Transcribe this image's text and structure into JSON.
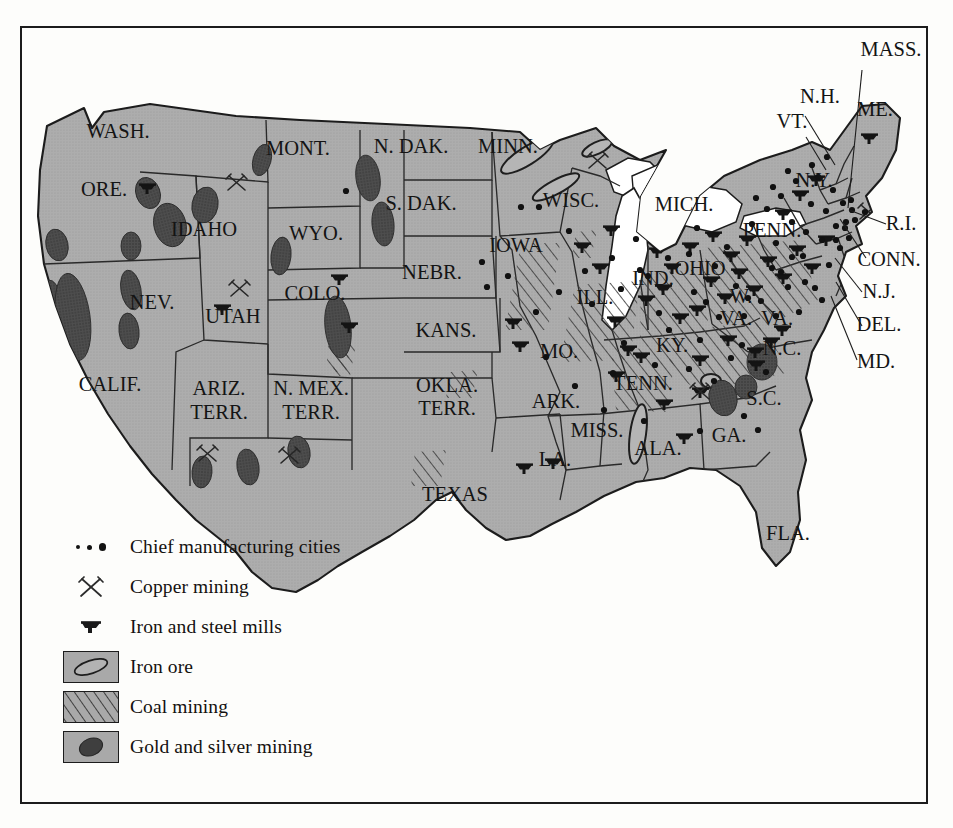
{
  "figure": {
    "kind": "thematic-map",
    "region": "United States",
    "era_note": "ARIZ. TERR., N. MEX. TERR., OKLA. TERR. shown as territories",
    "land_color": "#a9a9a9",
    "water_color": "#ffffff",
    "ink_color": "#1c1c1c",
    "ore_color": "#4a4a4a"
  },
  "legend": {
    "items": [
      {
        "symbol": "three-dots",
        "label": "Chief manufacturing cities"
      },
      {
        "symbol": "crossed-picks",
        "label": "Copper mining"
      },
      {
        "symbol": "anvil",
        "label": "Iron and steel mills"
      },
      {
        "symbol": "swatch-iron-ore",
        "label": "Iron ore"
      },
      {
        "symbol": "swatch-coal",
        "label": "Coal mining"
      },
      {
        "symbol": "swatch-gold",
        "label": "Gold and silver mining"
      }
    ]
  },
  "labels": {
    "inline": [
      {
        "text": "WASH.",
        "x": 118,
        "y": 138
      },
      {
        "text": "ORE.",
        "x": 104,
        "y": 196
      },
      {
        "text": "IDAHO",
        "x": 204,
        "y": 236
      },
      {
        "text": "MONT.",
        "x": 298,
        "y": 155
      },
      {
        "text": "WYO.",
        "x": 316,
        "y": 240
      },
      {
        "text": "N. DAK.",
        "x": 411,
        "y": 153
      },
      {
        "text": "S. DAK.",
        "x": 421,
        "y": 210
      },
      {
        "text": "NEBR.",
        "x": 432,
        "y": 279
      },
      {
        "text": "KANS.",
        "x": 446,
        "y": 337
      },
      {
        "text": "MINN.",
        "x": 508,
        "y": 153
      },
      {
        "text": "IOWA",
        "x": 516,
        "y": 252
      },
      {
        "text": "WISC.",
        "x": 571,
        "y": 207
      },
      {
        "text": "MICH.",
        "x": 684,
        "y": 211
      },
      {
        "text": "ILL.",
        "x": 595,
        "y": 304
      },
      {
        "text": "IND.",
        "x": 653,
        "y": 285
      },
      {
        "text": "OHIO",
        "x": 700,
        "y": 275
      },
      {
        "text": "MO.",
        "x": 559,
        "y": 358
      },
      {
        "text": "KY.",
        "x": 672,
        "y": 352
      },
      {
        "text": "NEV.",
        "x": 152,
        "y": 309
      },
      {
        "text": "UTAH",
        "x": 233,
        "y": 323
      },
      {
        "text": "COLO.",
        "x": 315,
        "y": 300
      },
      {
        "text": "CALIF.",
        "x": 110,
        "y": 391
      },
      {
        "text": "ARIZ.",
        "x": 219,
        "y": 395
      },
      {
        "text": "TERR.",
        "x": 219,
        "y": 419
      },
      {
        "text": "N. MEX.",
        "x": 311,
        "y": 395
      },
      {
        "text": "TERR.",
        "x": 311,
        "y": 419
      },
      {
        "text": "OKLA.",
        "x": 447,
        "y": 392
      },
      {
        "text": "TERR.",
        "x": 447,
        "y": 415
      },
      {
        "text": "ARK.",
        "x": 556,
        "y": 408
      },
      {
        "text": "TENN.",
        "x": 643,
        "y": 390
      },
      {
        "text": "MISS.",
        "x": 597,
        "y": 437
      },
      {
        "text": "LA.",
        "x": 555,
        "y": 466
      },
      {
        "text": "ALA.",
        "x": 658,
        "y": 455
      },
      {
        "text": "GA.",
        "x": 729,
        "y": 442
      },
      {
        "text": "FLA.",
        "x": 788,
        "y": 540
      },
      {
        "text": "S.C.",
        "x": 764,
        "y": 405
      },
      {
        "text": "N.C.",
        "x": 782,
        "y": 355
      },
      {
        "text": "W.",
        "x": 741,
        "y": 303
      },
      {
        "text": "VA.",
        "x": 736,
        "y": 325
      },
      {
        "text": "VA.",
        "x": 777,
        "y": 325
      },
      {
        "text": "PENN.",
        "x": 772,
        "y": 237
      },
      {
        "text": "N.Y.",
        "x": 814,
        "y": 187
      },
      {
        "text": "ME.",
        "x": 875,
        "y": 116
      },
      {
        "text": "TEXAS",
        "x": 455,
        "y": 501
      }
    ],
    "leader": [
      {
        "text": "MASS.",
        "x": 891,
        "y": 56,
        "lx": 862,
        "ly": 70,
        "tx": 848,
        "ty": 208
      },
      {
        "text": "N.H.",
        "x": 820,
        "y": 103,
        "lx": 805,
        "ly": 116,
        "tx": 835,
        "ty": 165
      },
      {
        "text": "VT.",
        "x": 792,
        "y": 128,
        "lx": 806,
        "ly": 137,
        "tx": 826,
        "ty": 170
      },
      {
        "text": "R.I.",
        "x": 901,
        "y": 230,
        "lx": 886,
        "ly": 224,
        "tx": 849,
        "ty": 210
      },
      {
        "text": "CONN.",
        "x": 889,
        "y": 266,
        "lx": 866,
        "ly": 258,
        "tx": 840,
        "ty": 219
      },
      {
        "text": "N.J.",
        "x": 879,
        "y": 298,
        "lx": 862,
        "ly": 292,
        "tx": 835,
        "ty": 258
      },
      {
        "text": "DEL.",
        "x": 879,
        "y": 331,
        "lx": 862,
        "ly": 326,
        "tx": 836,
        "ty": 282
      },
      {
        "text": "MD.",
        "x": 876,
        "y": 368,
        "lx": 857,
        "ly": 360,
        "tx": 831,
        "ty": 296
      }
    ]
  },
  "overlays": {
    "note": "symbol positions in page pixel coordinates",
    "cities": [
      [
        346,
        191
      ],
      [
        487,
        287
      ],
      [
        521,
        207
      ],
      [
        539,
        207
      ],
      [
        569,
        231
      ],
      [
        592,
        304
      ],
      [
        621,
        289
      ],
      [
        636,
        239
      ],
      [
        648,
        276
      ],
      [
        659,
        313
      ],
      [
        689,
        254
      ],
      [
        697,
        228
      ],
      [
        706,
        302
      ],
      [
        715,
        266
      ],
      [
        727,
        247
      ],
      [
        736,
        286
      ],
      [
        744,
        316
      ],
      [
        752,
        224
      ],
      [
        761,
        301
      ],
      [
        767,
        209
      ],
      [
        772,
        268
      ],
      [
        776,
        243
      ],
      [
        781,
        196
      ],
      [
        788,
        287
      ],
      [
        792,
        222
      ],
      [
        796,
        181
      ],
      [
        799,
        312
      ],
      [
        803,
        256
      ],
      [
        806,
        232
      ],
      [
        811,
        204
      ],
      [
        815,
        288
      ],
      [
        818,
        177
      ],
      [
        822,
        240
      ],
      [
        826,
        211
      ],
      [
        829,
        265
      ],
      [
        833,
        190
      ],
      [
        836,
        226
      ],
      [
        840,
        248
      ],
      [
        843,
        203
      ],
      [
        846,
        222
      ],
      [
        849,
        238
      ],
      [
        852,
        210
      ],
      [
        856,
        254
      ],
      [
        812,
        165
      ],
      [
        827,
        157
      ],
      [
        788,
        171
      ],
      [
        773,
        187
      ],
      [
        756,
        198
      ],
      [
        624,
        343
      ],
      [
        655,
        365
      ],
      [
        689,
        369
      ],
      [
        714,
        381
      ],
      [
        742,
        345
      ],
      [
        766,
        372
      ],
      [
        619,
        517
      ],
      [
        700,
        431
      ],
      [
        744,
        416
      ],
      [
        758,
        430
      ],
      [
        613,
        373
      ],
      [
        669,
        330
      ],
      [
        700,
        340
      ],
      [
        731,
        358
      ],
      [
        781,
        272
      ],
      [
        792,
        257
      ],
      [
        836,
        240
      ],
      [
        845,
        228
      ],
      [
        855,
        220
      ],
      [
        862,
        232
      ],
      [
        851,
        200
      ],
      [
        865,
        212
      ],
      [
        822,
        300
      ],
      [
        805,
        282
      ],
      [
        776,
        316
      ],
      [
        748,
        298
      ],
      [
        719,
        317
      ],
      [
        694,
        292
      ],
      [
        668,
        258
      ],
      [
        640,
        270
      ],
      [
        612,
        258
      ],
      [
        585,
        271
      ],
      [
        559,
        292
      ],
      [
        536,
        312
      ],
      [
        508,
        276
      ],
      [
        482,
        262
      ],
      [
        604,
        410
      ],
      [
        575,
        386
      ],
      [
        546,
        357
      ],
      [
        644,
        421
      ]
    ],
    "mills": [
      [
        147,
        188
      ],
      [
        611,
        230
      ],
      [
        615,
        321
      ],
      [
        628,
        350
      ],
      [
        222,
        309
      ],
      [
        339,
        279
      ],
      [
        349,
        327
      ],
      [
        513,
        323
      ],
      [
        520,
        346
      ],
      [
        582,
        247
      ],
      [
        600,
        268
      ],
      [
        646,
        300
      ],
      [
        663,
        289
      ],
      [
        680,
        318
      ],
      [
        697,
        310
      ],
      [
        711,
        281
      ],
      [
        725,
        298
      ],
      [
        739,
        273
      ],
      [
        754,
        290
      ],
      [
        768,
        261
      ],
      [
        783,
        278
      ],
      [
        797,
        250
      ],
      [
        812,
        268
      ],
      [
        826,
        240
      ],
      [
        700,
        360
      ],
      [
        728,
        340
      ],
      [
        755,
        352
      ],
      [
        782,
        330
      ],
      [
        700,
        392
      ],
      [
        684,
        438
      ],
      [
        664,
        404
      ],
      [
        553,
        463
      ],
      [
        616,
        376
      ],
      [
        641,
        357
      ],
      [
        869,
        138
      ],
      [
        800,
        195
      ],
      [
        783,
        214
      ],
      [
        816,
        180
      ],
      [
        747,
        240
      ],
      [
        731,
        256
      ],
      [
        713,
        236
      ],
      [
        690,
        247
      ],
      [
        672,
        268
      ],
      [
        657,
        252
      ],
      [
        524,
        468
      ],
      [
        756,
        365
      ],
      [
        771,
        342
      ]
    ],
    "copper": [
      [
        239,
        288
      ],
      [
        236,
        182
      ],
      [
        597,
        160
      ],
      [
        700,
        391
      ],
      [
        207,
        453
      ],
      [
        289,
        455
      ],
      [
        868,
        211
      ]
    ],
    "gold_blobs": [
      {
        "cx": 368,
        "cy": 178,
        "rx": 12,
        "ry": 23,
        "rot": -8
      },
      {
        "cx": 262,
        "cy": 160,
        "rx": 9,
        "ry": 16,
        "rot": 15
      },
      {
        "cx": 383,
        "cy": 224,
        "rx": 11,
        "ry": 22,
        "rot": -5
      },
      {
        "cx": 281,
        "cy": 256,
        "rx": 10,
        "ry": 19,
        "rot": 6
      },
      {
        "cx": 148,
        "cy": 193,
        "rx": 12,
        "ry": 16,
        "rot": -20
      },
      {
        "cx": 170,
        "cy": 225,
        "rx": 16,
        "ry": 22,
        "rot": -15
      },
      {
        "cx": 205,
        "cy": 205,
        "rx": 13,
        "ry": 18,
        "rot": 10
      },
      {
        "cx": 131,
        "cy": 246,
        "rx": 10,
        "ry": 14,
        "rot": 0
      },
      {
        "cx": 57,
        "cy": 245,
        "rx": 11,
        "ry": 16,
        "rot": -12
      },
      {
        "cx": 50,
        "cy": 297,
        "rx": 10,
        "ry": 17,
        "rot": -5
      },
      {
        "cx": 73,
        "cy": 317,
        "rx": 17,
        "ry": 44,
        "rot": -8
      },
      {
        "cx": 131,
        "cy": 290,
        "rx": 10,
        "ry": 20,
        "rot": -10
      },
      {
        "cx": 129,
        "cy": 331,
        "rx": 10,
        "ry": 18,
        "rot": -6
      },
      {
        "cx": 338,
        "cy": 327,
        "rx": 13,
        "ry": 31,
        "rot": -6
      },
      {
        "cx": 248,
        "cy": 467,
        "rx": 11,
        "ry": 18,
        "rot": -8
      },
      {
        "cx": 202,
        "cy": 472,
        "rx": 10,
        "ry": 16,
        "rot": 5
      },
      {
        "cx": 299,
        "cy": 452,
        "rx": 11,
        "ry": 16,
        "rot": -10
      },
      {
        "cx": 762,
        "cy": 362,
        "rx": 15,
        "ry": 18,
        "rot": 0
      },
      {
        "cx": 723,
        "cy": 398,
        "rx": 14,
        "ry": 18,
        "rot": -12
      },
      {
        "cx": 746,
        "cy": 387,
        "rx": 11,
        "ry": 12,
        "rot": 0
      }
    ],
    "iron_ore": [
      {
        "cx": 527,
        "cy": 156,
        "rx": 30,
        "ry": 9,
        "rot": -32
      },
      {
        "cx": 556,
        "cy": 187,
        "rx": 26,
        "ry": 7,
        "rot": -28
      },
      {
        "cx": 597,
        "cy": 148,
        "rx": 16,
        "ry": 6,
        "rot": -25
      },
      {
        "cx": 638,
        "cy": 434,
        "rx": 8,
        "ry": 30,
        "rot": 8
      },
      {
        "cx": 711,
        "cy": 381,
        "rx": 10,
        "ry": 7,
        "rot": 0
      }
    ],
    "coal_zones": [
      {
        "pts": "521,243 560,243 548,330 505,330",
        "label": "Iowa-Missouri"
      },
      {
        "pts": "575,285 640,281 630,360 560,362",
        "label": "Illinois basin"
      },
      {
        "pts": "641,274 712,268 706,342 640,348",
        "label": "Indiana-Ohio"
      },
      {
        "pts": "705,248 800,240 818,300 760,330 710,322",
        "label": "Appalachian north"
      },
      {
        "pts": "680,330 760,322 790,372 700,392 666,368",
        "label": "Appalachian south"
      },
      {
        "pts": "611,352 676,344 668,412 616,410",
        "label": "Tennessee-Kentucky"
      },
      {
        "pts": "329,338 352,336 346,372 326,372",
        "label": "Colorado"
      },
      {
        "pts": "337,346 356,344 350,376 332,376",
        "label": "Colorado-south"
      },
      {
        "pts": "450,372 478,370 472,398 446,398",
        "label": "Oklahoma"
      },
      {
        "pts": "415,452 446,450 440,486 411,486",
        "label": "Texas"
      },
      {
        "pts": "576,232 597,230 591,258 572,258",
        "label": "Wisconsin-edge"
      }
    ]
  }
}
